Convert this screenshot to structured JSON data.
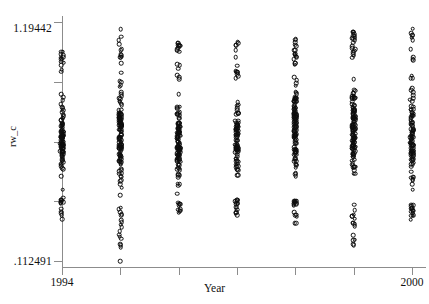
{
  "chart_data": {
    "type": "scatter",
    "title": "",
    "xlabel": "Year",
    "ylabel": "rw_c",
    "xlim": [
      1994,
      2000
    ],
    "ylim": [
      0.112491,
      1.19442
    ],
    "ytick_labels": [
      "1.19442",
      ".112491"
    ],
    "xtick_labels": [
      "1994",
      "2000"
    ],
    "grid": false,
    "legend": false,
    "marker": "open-circle",
    "categories": [
      1994,
      1995,
      1996,
      1997,
      1998,
      1999,
      2000
    ],
    "series": [
      {
        "name": "rw_c by Year",
        "points_per_year": [
          118,
          150,
          128,
          112,
          146,
          150,
          120
        ],
        "year_ranges": [
          {
            "year": 1994,
            "min": 0.3,
            "max": 1.06,
            "dense_low": 0.4,
            "dense_high": 0.95
          },
          {
            "year": 1995,
            "min": 0.1125,
            "max": 1.185,
            "dense_low": 0.36,
            "dense_high": 1.0
          },
          {
            "year": 1996,
            "min": 0.32,
            "max": 1.1,
            "dense_low": 0.38,
            "dense_high": 0.93
          },
          {
            "year": 1997,
            "min": 0.31,
            "max": 1.11,
            "dense_low": 0.4,
            "dense_high": 0.92
          },
          {
            "year": 1998,
            "min": 0.28,
            "max": 1.12,
            "dense_low": 0.39,
            "dense_high": 0.99
          },
          {
            "year": 1999,
            "min": 0.18,
            "max": 1.15,
            "dense_low": 0.38,
            "dense_high": 1.02
          },
          {
            "year": 2000,
            "min": 0.29,
            "max": 1.17,
            "dense_low": 0.37,
            "dense_high": 1.0
          }
        ],
        "outliers": [
          {
            "year": 1995,
            "value": 0.1125
          },
          {
            "year": 1999,
            "value": 0.183
          }
        ]
      }
    ]
  },
  "axes": {
    "y_max_label": "1.19442",
    "y_min_label": ".112491",
    "y_title": "rw_c",
    "x_title": "Year",
    "x_left_label": "1994",
    "x_right_label": "2000"
  }
}
